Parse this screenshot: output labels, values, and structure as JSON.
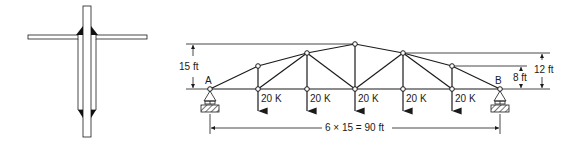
{
  "figure": {
    "left_detail": {
      "name": "welded T-joint detail",
      "description": "Flange plate with vertical stem plate, triangular fillet welds at top and bottom of stem"
    },
    "truss": {
      "support_left_label": "A",
      "support_right_label": "B",
      "panels": 6,
      "panel_length_ft": 15,
      "span_label": "6 × 15 = 90 ft",
      "height_label_left": "15 ft",
      "height_label_right_outer": "12 ft",
      "height_label_right_inner": "8 ft",
      "loads": [
        {
          "label": "20 K",
          "panel_point": 1
        },
        {
          "label": "20 K",
          "panel_point": 2
        },
        {
          "label": "20 K",
          "panel_point": 3
        },
        {
          "label": "20 K",
          "panel_point": 4
        },
        {
          "label": "20 K",
          "panel_point": 5
        }
      ],
      "top_chord_heights_ft": [
        0,
        8,
        12,
        15,
        12,
        8,
        0
      ]
    },
    "colors": {
      "line": "#1a1a1a",
      "background": "#ffffff"
    }
  }
}
